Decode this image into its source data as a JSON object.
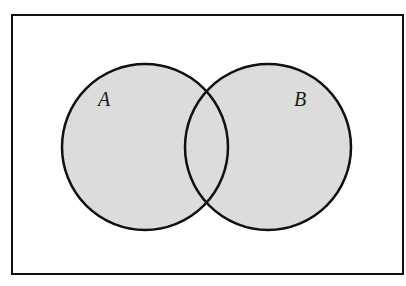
{
  "diagram": {
    "type": "venn",
    "universe": {
      "x": 12,
      "y": 15,
      "width": 391,
      "height": 259
    },
    "sets": [
      {
        "label": "A",
        "cx": 145,
        "cy": 147,
        "r": 83,
        "label_x": 98,
        "label_y": 106
      },
      {
        "label": "B",
        "cx": 268,
        "cy": 147,
        "r": 83,
        "label_x": 294,
        "label_y": 106
      }
    ],
    "colors": {
      "fill": "#dcdcdc",
      "stroke": "#111111",
      "background": "#ffffff"
    }
  }
}
